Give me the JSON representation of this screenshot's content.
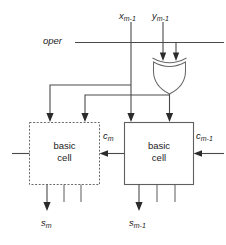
{
  "diagram": {
    "type": "logic-circuit-schematic",
    "colors": {
      "background": "#ffffff",
      "wire": "#4a4a4a",
      "outline": "#5f5f5f",
      "text": "#1c1c1c",
      "arrow": "#2b2b2b"
    }
  },
  "inputs": {
    "x_label": "x",
    "x_sub": "m-1",
    "y_label": "y",
    "y_sub": "m-1",
    "oper_label": "oper"
  },
  "gate": {
    "name": "xor-gate",
    "type": "XOR",
    "input_count": 2,
    "output_count": 1
  },
  "cells": [
    {
      "id": "left",
      "line1": "basic",
      "line2": "cell",
      "border": "dashed",
      "input_arrows": 2,
      "output_lines": 3
    },
    {
      "id": "right",
      "line1": "basic",
      "line2": "cell",
      "border": "solid",
      "input_arrows": 2,
      "output_lines": 3
    }
  ],
  "carries": {
    "out_label": "c",
    "out_sub": "m",
    "in_label": "c",
    "in_sub": "m-1"
  },
  "outputs": {
    "left_label": "s",
    "left_sub": "m",
    "right_label": "s",
    "right_sub": "m-1"
  }
}
